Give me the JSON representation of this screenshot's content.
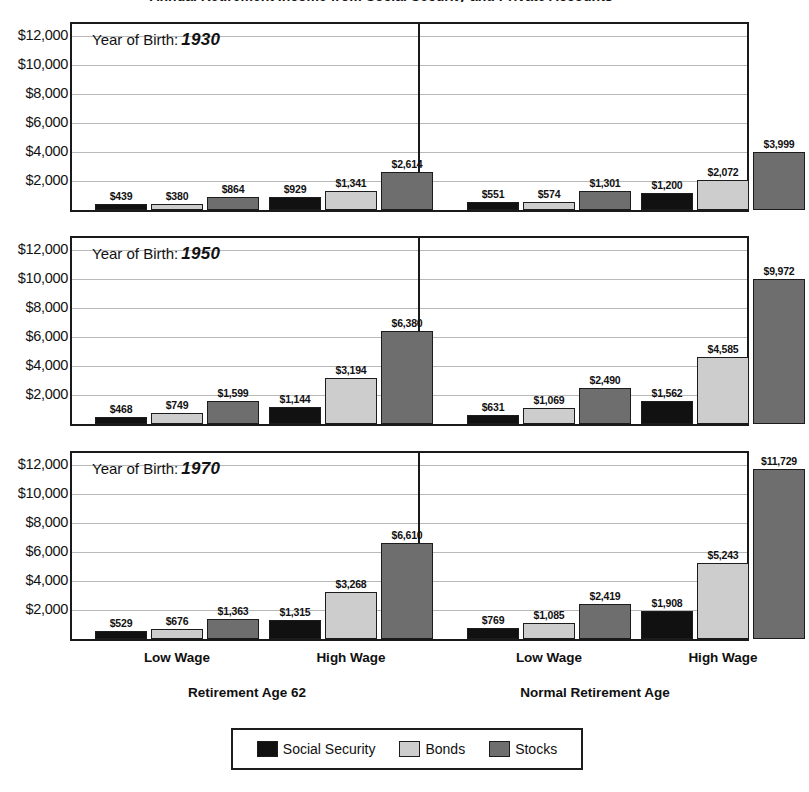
{
  "chart_data": {
    "type": "bar",
    "title": "Annual Retirement Income from Social Security and Private Accounts",
    "xlabel": "",
    "ylabel": "",
    "ylim": [
      0,
      12800
    ],
    "grid": true,
    "legend_position": "bottom",
    "y_ticks": [
      "$2,000",
      "$4,000",
      "$6,000",
      "$8,000",
      "$10,000",
      "$12,000"
    ],
    "y_tick_values": [
      2000,
      4000,
      6000,
      8000,
      10000,
      12000
    ],
    "legend": [
      "Social Security",
      "Bonds",
      "Stocks"
    ],
    "series_colors": [
      "#111111",
      "#cdcdcd",
      "#6e6e6e"
    ],
    "sections": [
      "Retirement Age 62",
      "Normal Retirement Age"
    ],
    "categories": [
      "Low Wage",
      "High Wage",
      "Low Wage",
      "High Wage"
    ],
    "panel_caption": "Year of Birth:",
    "panels": [
      {
        "year": "1930",
        "groups": [
          {
            "label": "Low Wage",
            "section": "Retirement Age 62",
            "values": [
              439,
              380,
              864
            ],
            "labels": [
              "$439",
              "$380",
              "$864"
            ]
          },
          {
            "label": "High Wage",
            "section": "Retirement Age 62",
            "values": [
              929,
              1341,
              2614
            ],
            "labels": [
              "$929",
              "$1,341",
              "$2,614"
            ]
          },
          {
            "label": "Low Wage",
            "section": "Normal Retirement Age",
            "values": [
              551,
              574,
              1301
            ],
            "labels": [
              "$551",
              "$574",
              "$1,301"
            ]
          },
          {
            "label": "High Wage",
            "section": "Normal Retirement Age",
            "values": [
              1200,
              2072,
              3999
            ],
            "labels": [
              "$1,200",
              "$2,072",
              "$3,999"
            ]
          }
        ]
      },
      {
        "year": "1950",
        "groups": [
          {
            "label": "Low Wage",
            "section": "Retirement Age 62",
            "values": [
              468,
              749,
              1599
            ],
            "labels": [
              "$468",
              "$749",
              "$1,599"
            ]
          },
          {
            "label": "High Wage",
            "section": "Retirement Age 62",
            "values": [
              1144,
              3194,
              6380
            ],
            "labels": [
              "$1,144",
              "$3,194",
              "$6,380"
            ]
          },
          {
            "label": "Low Wage",
            "section": "Normal Retirement Age",
            "values": [
              631,
              1069,
              2490
            ],
            "labels": [
              "$631",
              "$1,069",
              "$2,490"
            ]
          },
          {
            "label": "High Wage",
            "section": "Normal Retirement Age",
            "values": [
              1562,
              4585,
              9972
            ],
            "labels": [
              "$1,562",
              "$4,585",
              "$9,972"
            ]
          }
        ]
      },
      {
        "year": "1970",
        "groups": [
          {
            "label": "Low Wage",
            "section": "Retirement Age 62",
            "values": [
              529,
              676,
              1363
            ],
            "labels": [
              "$529",
              "$676",
              "$1,363"
            ]
          },
          {
            "label": "High Wage",
            "section": "Retirement Age 62",
            "values": [
              1315,
              3268,
              6610
            ],
            "labels": [
              "$1,315",
              "$3,268",
              "$6,610"
            ]
          },
          {
            "label": "Low Wage",
            "section": "Normal Retirement Age",
            "values": [
              769,
              1085,
              2419
            ],
            "labels": [
              "$769",
              "$1,085",
              "$2,419"
            ]
          },
          {
            "label": "High Wage",
            "section": "Normal Retirement Age",
            "values": [
              1908,
              5243,
              11729
            ],
            "labels": [
              "$1,908",
              "$5,243",
              "$11,729"
            ]
          }
        ]
      }
    ]
  }
}
